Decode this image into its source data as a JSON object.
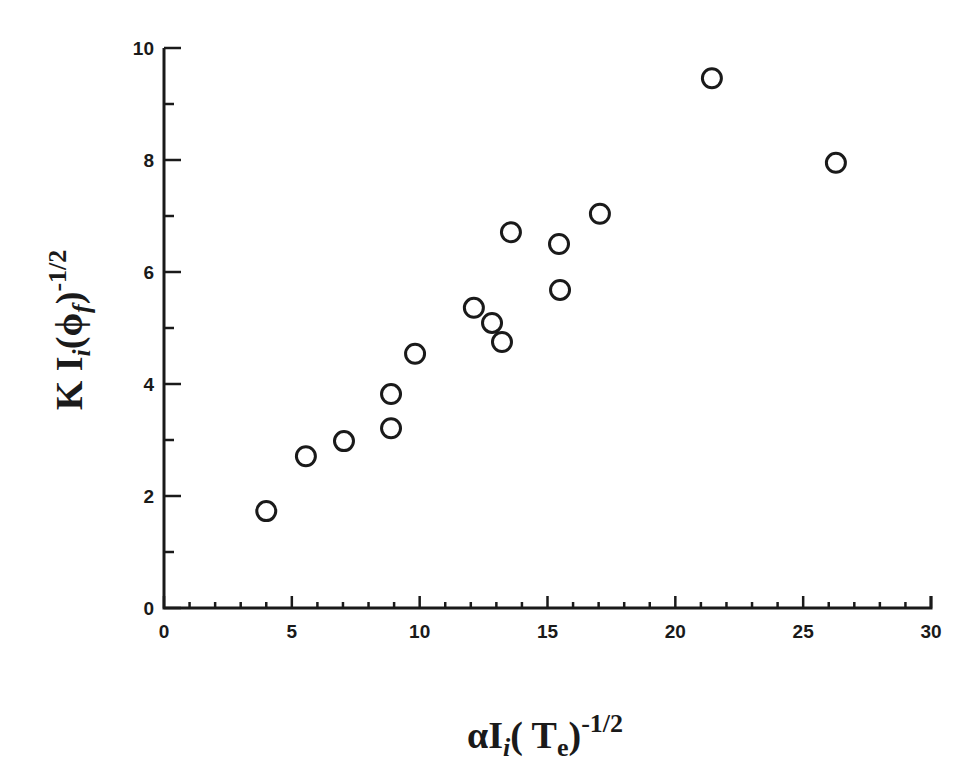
{
  "chart_data": {
    "type": "scatter",
    "title": "",
    "xlabel": {
      "prefix": "αI",
      "subscript_i": "i",
      "open": "( T",
      "subscript_e": "e",
      "close": ")",
      "superscript": "-1/2"
    },
    "ylabel": {
      "prefix": "K I",
      "subscript_i": "i",
      "open": "(ϕ",
      "subscript_f": "f",
      "close": ")",
      "superscript": "-1/2"
    },
    "xlim": [
      0,
      30
    ],
    "ylim": [
      0,
      10
    ],
    "x_major_ticks": [
      0,
      5,
      10,
      15,
      20,
      25,
      30
    ],
    "x_tick_labels": [
      "0",
      "5",
      "10",
      "15",
      "20",
      "25",
      "30"
    ],
    "x_minor_step": 1,
    "y_major_ticks": [
      0,
      2,
      4,
      6,
      8,
      10
    ],
    "y_tick_labels": [
      "0",
      "2",
      "4",
      "6",
      "8",
      "10"
    ],
    "y_minor_step": 1,
    "grid": false,
    "legend": null,
    "marker": "open-circle",
    "series": [
      {
        "name": "data",
        "points": [
          {
            "x": 4.0,
            "y": 1.73
          },
          {
            "x": 5.55,
            "y": 2.71
          },
          {
            "x": 7.04,
            "y": 2.98
          },
          {
            "x": 8.88,
            "y": 3.82
          },
          {
            "x": 8.88,
            "y": 3.21
          },
          {
            "x": 9.82,
            "y": 4.54
          },
          {
            "x": 12.12,
            "y": 5.36
          },
          {
            "x": 12.83,
            "y": 5.09
          },
          {
            "x": 13.22,
            "y": 4.75
          },
          {
            "x": 13.57,
            "y": 6.71
          },
          {
            "x": 15.45,
            "y": 6.5
          },
          {
            "x": 15.49,
            "y": 5.68
          },
          {
            "x": 17.05,
            "y": 7.04
          },
          {
            "x": 21.43,
            "y": 9.46
          },
          {
            "x": 26.28,
            "y": 7.95
          }
        ]
      }
    ]
  },
  "colors": {
    "ink": "#1a1a1a",
    "background": "#ffffff"
  }
}
